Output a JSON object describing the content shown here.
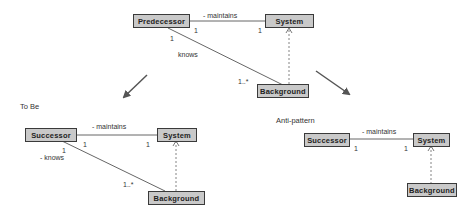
{
  "top": {
    "predecessor": "Predecessor",
    "system": "System",
    "background": "Background",
    "maintains": "- maintains",
    "mult_pred_maint": "1",
    "mult_sys_maint": "1",
    "mult_pred_knows": "1",
    "knows": "knows",
    "mult_bg_knows": "1..*"
  },
  "to_be": {
    "title": "To Be",
    "successor": "Successor",
    "system": "System",
    "background": "Background",
    "maintains": "- maintains",
    "mult_succ_maint": "1",
    "mult_sys_maint": "1",
    "mult_succ_knows": "1",
    "knows": "- knows",
    "mult_bg_knows": "1..*"
  },
  "anti_pattern": {
    "title": "Anti-pattern",
    "successor": "Successor",
    "system": "System",
    "background": "Background",
    "maintains": "- maintains",
    "mult_succ_maint": "1",
    "mult_sys_maint": "1"
  },
  "colors": {
    "box_fill": "#c9c9c9",
    "box_border": "#3a3a3a",
    "line": "#555555",
    "arrow": "#555555"
  }
}
